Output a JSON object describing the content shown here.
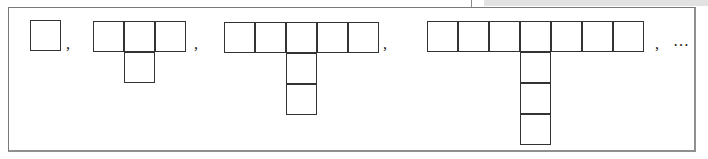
{
  "diagram": {
    "cell_size_px": 31,
    "stroke_color": "#333333",
    "frame_color": "#7a7a7a",
    "figures": [
      {
        "index": 1,
        "row_cells": 1,
        "column_cells": 0,
        "x": 30,
        "y": 20
      },
      {
        "index": 2,
        "row_cells": 3,
        "column_cells": 1,
        "x": 93,
        "y": 21
      },
      {
        "index": 3,
        "row_cells": 5,
        "column_cells": 2,
        "x": 224,
        "y": 22
      },
      {
        "index": 4,
        "row_cells": 7,
        "column_cells": 3,
        "x": 427,
        "y": 21
      }
    ],
    "separators": [
      ",",
      ",",
      ",",
      ","
    ],
    "continuation": "…"
  }
}
